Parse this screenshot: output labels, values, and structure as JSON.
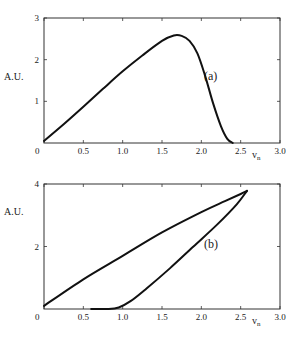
{
  "chart_data": [
    {
      "type": "line",
      "panel_label": "(a)",
      "xlabel": "v",
      "xlabel_subscript": "n",
      "ylabel": "A.U.",
      "xlim": [
        0,
        3.0
      ],
      "ylim": [
        0,
        3
      ],
      "x_ticks": [
        "0",
        "0.5",
        "1.0",
        "1.5",
        "2.0",
        "2.5",
        "3.0"
      ],
      "y_ticks": [
        "1",
        "2",
        "3"
      ],
      "grid": false,
      "series": [
        {
          "name": "curve-a",
          "x": [
            0.0,
            0.25,
            0.5,
            0.75,
            1.0,
            1.25,
            1.5,
            1.65,
            1.75,
            1.85,
            1.95,
            2.05,
            2.15,
            2.25,
            2.33,
            2.4
          ],
          "y": [
            0.05,
            0.45,
            0.87,
            1.3,
            1.72,
            2.1,
            2.45,
            2.58,
            2.57,
            2.45,
            2.15,
            1.6,
            0.95,
            0.4,
            0.1,
            0.0
          ]
        }
      ]
    },
    {
      "type": "line",
      "panel_label": "(b)",
      "xlabel": "v",
      "xlabel_subscript": "n",
      "ylabel": "A.U.",
      "xlim": [
        0,
        3.0
      ],
      "ylim": [
        0,
        4
      ],
      "x_ticks": [
        "0",
        "0.5",
        "1.0",
        "1.5",
        "2.0",
        "2.5",
        "3.0"
      ],
      "y_ticks": [
        "2",
        "4"
      ],
      "grid": false,
      "series": [
        {
          "name": "loop-upper-branch",
          "x": [
            0.0,
            0.5,
            1.0,
            1.5,
            2.0,
            2.3,
            2.5,
            2.58
          ],
          "y": [
            0.1,
            0.95,
            1.7,
            2.45,
            3.1,
            3.45,
            3.68,
            3.78
          ]
        },
        {
          "name": "loop-lower-branch",
          "x": [
            0.6,
            0.8,
            0.95,
            1.1,
            1.3,
            1.6,
            1.9,
            2.2,
            2.45,
            2.58
          ],
          "y": [
            0.0,
            0.0,
            0.05,
            0.25,
            0.65,
            1.3,
            2.0,
            2.7,
            3.35,
            3.78
          ]
        }
      ]
    }
  ]
}
